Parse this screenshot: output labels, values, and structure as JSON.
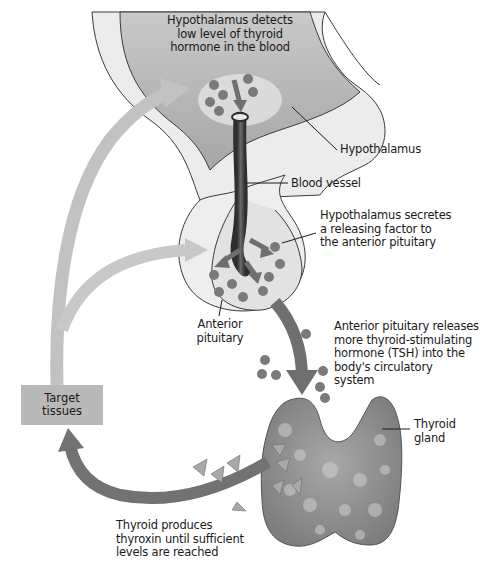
{
  "diagram": {
    "colors": {
      "brain_tissue": "#e9e9e9",
      "hypothalamus_fill": "#b8b8b8",
      "blood_vessel": "#4a4a4a",
      "hormone_dot": "#7a7a7a",
      "flow_arrow_light": "#bdbdbd",
      "flow_arrow_dark": "#6f6f6f",
      "thyroid": "#8f8f8f",
      "thyroxin_triangle": "#a9a9a9",
      "target_box": "#b9b9b9"
    },
    "labels": {
      "hypothalamus_detects": [
        "Hypothalamus detects",
        "low level of thyroid",
        "hormone in the blood"
      ],
      "hypothalamus": "Hypothalamus",
      "blood_vessel": "Blood vessel",
      "hypothalamus_secretes": [
        "Hypothalamus secretes",
        "a releasing factor to",
        "the anterior pituitary"
      ],
      "anterior_pituitary": [
        "Anterior",
        "pituitary"
      ],
      "pituitary_releases": [
        "Anterior pituitary releases",
        "more thyroid-stimulating",
        "hormone (TSH) into the",
        "body's circulatory",
        "system"
      ],
      "target_tissues": [
        "Target",
        "tissues"
      ],
      "thyroid_gland": [
        "Thyroid",
        "gland"
      ],
      "thyroid_produces": [
        "Thyroid produces",
        "thyroxin until sufficient",
        "levels are reached"
      ]
    },
    "nodes": [
      {
        "id": "hypothalamus",
        "label": "Hypothalamus"
      },
      {
        "id": "blood_vessel",
        "label": "Blood vessel"
      },
      {
        "id": "anterior_pituitary",
        "label": "Anterior pituitary"
      },
      {
        "id": "thyroid_gland",
        "label": "Thyroid gland"
      },
      {
        "id": "target_tissues",
        "label": "Target tissues"
      }
    ],
    "edges": [
      {
        "from": "hypothalamus",
        "to": "anterior_pituitary",
        "via": "blood_vessel",
        "label": "releasing factor"
      },
      {
        "from": "anterior_pituitary",
        "to": "thyroid_gland",
        "label": "TSH"
      },
      {
        "from": "thyroid_gland",
        "to": "target_tissues",
        "label": "thyroxin"
      },
      {
        "from": "target_tissues",
        "to": "hypothalamus",
        "label": "feedback"
      },
      {
        "from": "target_tissues",
        "to": "anterior_pituitary",
        "label": "feedback"
      }
    ]
  }
}
